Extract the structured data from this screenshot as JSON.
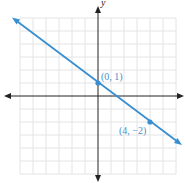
{
  "chart_data": {
    "type": "line",
    "title": "",
    "xlabel": "",
    "ylabel": "y",
    "xlim": [
      -6,
      6
    ],
    "ylim": [
      -6,
      6
    ],
    "grid": true,
    "series": [
      {
        "name": "line",
        "equation": "y = -3/4 x + 1",
        "slope": -0.75,
        "intercept": 1,
        "color": "#3a8fd1",
        "points": [
          {
            "x": 0,
            "y": 1,
            "label": "(0, 1)"
          },
          {
            "x": 4,
            "y": -2,
            "label": "(4, −2)"
          }
        ]
      }
    ]
  },
  "labels": {
    "y_axis": "y",
    "p1": "(0, 1)",
    "p2": "(4, −2)"
  },
  "colors": {
    "line": "#3a8fd1",
    "grid": "#e4e4e4",
    "axis": "#222222",
    "label": "#4a90c8"
  }
}
